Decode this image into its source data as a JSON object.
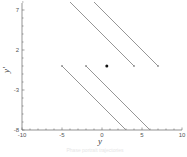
{
  "chart_data": {
    "type": "line",
    "title": "",
    "xlabel": "y",
    "ylabel": "y'",
    "xlim": [
      -10,
      10
    ],
    "ylim": [
      -8,
      8
    ],
    "x_ticks": [
      "-10",
      "-5",
      "0",
      "5",
      "10"
    ],
    "y_ticks": [
      "7",
      "2",
      "-3",
      "-8"
    ],
    "grid": false,
    "legend": null,
    "series": [
      {
        "name": "segment-1",
        "points": [
          [
            -4,
            8
          ],
          [
            4,
            0
          ]
        ],
        "end_marker": [
          4,
          0
        ]
      },
      {
        "name": "segment-2",
        "points": [
          [
            -1,
            8
          ],
          [
            7,
            0
          ]
        ],
        "end_marker": [
          7,
          0
        ]
      },
      {
        "name": "segment-3",
        "points": [
          [
            -5,
            0
          ],
          [
            3,
            -8
          ]
        ],
        "start_marker": [
          -5,
          0
        ]
      },
      {
        "name": "segment-4",
        "points": [
          [
            -2,
            0
          ],
          [
            6,
            -8
          ]
        ],
        "start_marker": [
          -2,
          0
        ]
      }
    ],
    "points": [
      {
        "name": "equilibrium-point",
        "x": 0.6,
        "y": 0
      }
    ],
    "colors": {
      "lines": "#8a8a8a",
      "point": "#111111",
      "axes": "#666666"
    }
  },
  "axes": {
    "x_title": "y",
    "y_title": "y'",
    "x_tick_labels": [
      "-10",
      "-5",
      "0",
      "5",
      "10"
    ],
    "y_tick_labels": [
      "7",
      "2",
      "-3",
      "-8"
    ]
  },
  "caption": "Phase portrait trajectories"
}
